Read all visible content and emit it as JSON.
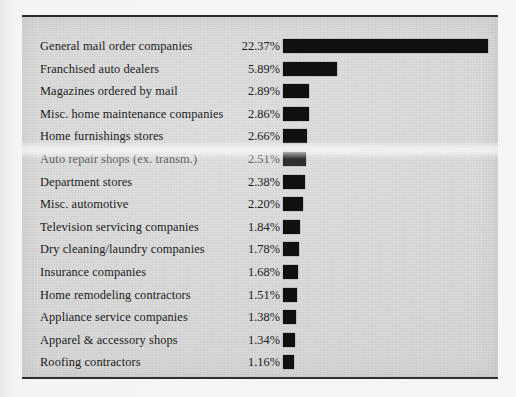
{
  "chart_data": {
    "type": "bar",
    "orientation": "horizontal",
    "title": "",
    "subtitle": "",
    "xlabel": "",
    "ylabel": "",
    "grid": false,
    "legend": null,
    "value_suffix": "%",
    "xlim": [
      0,
      22.37
    ],
    "categories": [
      "General mail order companies",
      "Franchised auto dealers",
      "Magazines ordered by mail",
      "Misc. home maintenance companies",
      "Home furnishings stores",
      "Auto repair shops (ex. transm.)",
      "Department stores",
      "Misc. automotive",
      "Television servicing companies",
      "Dry cleaning/laundry companies",
      "Insurance companies",
      "Home remodeling contractors",
      "Appliance service companies",
      "Apparel & accessory shops",
      "Roofing contractors"
    ],
    "values": [
      22.37,
      5.89,
      2.89,
      2.86,
      2.66,
      2.51,
      2.38,
      2.2,
      1.84,
      1.78,
      1.68,
      1.51,
      1.38,
      1.34,
      1.16
    ],
    "value_labels": [
      "22.37%",
      "5.89%",
      "2.89%",
      "2.86%",
      "2.66%",
      "2.51%",
      "2.38%",
      "2.20%",
      "1.84%",
      "1.78%",
      "1.68%",
      "1.51%",
      "1.38%",
      "1.34%",
      "1.16%"
    ]
  },
  "style": {
    "bar_color": "#101010",
    "text_color": "#1b1b1b",
    "panel_color": "#d6d6d6",
    "page_color": "#f3f3f3",
    "rule_color": "#2a2a2a"
  },
  "artifacts": {
    "faded_row_index": 5
  }
}
